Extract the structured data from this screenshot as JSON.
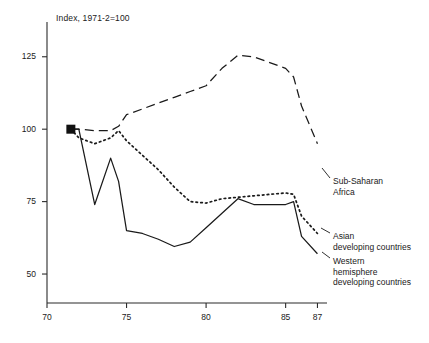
{
  "chart_data": {
    "type": "line",
    "title": "Index, 1971-2=100",
    "xlabel": "",
    "ylabel": "",
    "xlim": [
      70,
      87.6
    ],
    "ylim": [
      40,
      137
    ],
    "grid": false,
    "legend_position": "right-inline-annotations",
    "xticks": [
      70,
      75,
      80,
      85,
      87
    ],
    "xtick_labels": [
      "70",
      "75",
      "80",
      "85",
      "87"
    ],
    "yticks": [
      50,
      75,
      100,
      125
    ],
    "ytick_labels": [
      "50",
      "75",
      "100",
      "125"
    ],
    "start_marker": {
      "x": 71.5,
      "y": 100,
      "shape": "filled-square"
    },
    "series": [
      {
        "name": "Sub-Saharan Africa",
        "style": "dashed",
        "label_lines": [
          "Sub-Saharan",
          "Africa"
        ],
        "x": [
          71.5,
          72,
          73,
          74,
          74.5,
          75,
          76,
          77,
          78,
          79,
          80,
          81,
          82,
          83,
          84,
          85,
          85.5,
          86,
          87
        ],
        "values": [
          100,
          100,
          99.5,
          99.5,
          101,
          105,
          107,
          109,
          111,
          113,
          115,
          121,
          125.5,
          125,
          123,
          121,
          118,
          108,
          95
        ]
      },
      {
        "name": "Asian developing countries",
        "style": "dotted",
        "label_lines": [
          "Asian",
          "developing countries"
        ],
        "x": [
          71.5,
          72,
          73,
          74,
          74.5,
          75,
          76,
          77,
          78,
          79,
          80,
          81,
          82,
          83,
          84,
          85,
          85.5,
          86,
          87
        ],
        "values": [
          100,
          97,
          95,
          97,
          99.5,
          96,
          91,
          86,
          80,
          75,
          74.5,
          76,
          76.5,
          77,
          77.5,
          78,
          77.5,
          70,
          64
        ]
      },
      {
        "name": "Western hemisphere developing countries",
        "style": "solid",
        "label_lines": [
          "Western",
          "hemisphere",
          "developing countries"
        ],
        "x": [
          71.5,
          72,
          73,
          74,
          74.5,
          75,
          76,
          77,
          78,
          79,
          80,
          81,
          82,
          83,
          84,
          85,
          85.5,
          86,
          87
        ],
        "values": [
          100,
          100,
          74,
          90,
          82,
          65,
          64,
          62,
          59.5,
          61,
          66,
          71,
          76,
          74,
          74,
          74,
          75,
          63,
          57
        ]
      }
    ]
  }
}
